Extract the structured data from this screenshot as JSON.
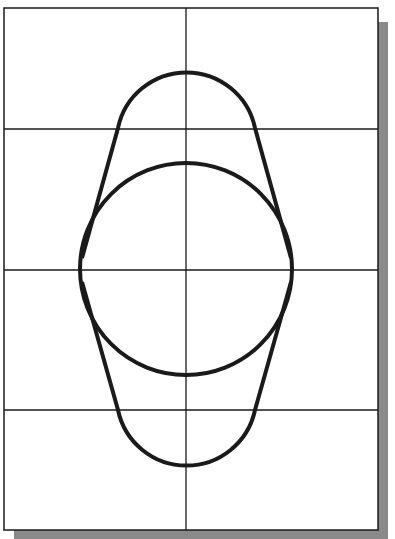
{
  "diagram": {
    "colors": {
      "line": "#1a1a1a",
      "shadow": "#8a8a8a",
      "paper": "#ffffff"
    },
    "frame": {
      "x": 4,
      "y": 8,
      "w": 374,
      "h": 522
    },
    "grid": {
      "vertical_x": [
        186
      ],
      "horizontal_y": [
        129,
        270,
        410
      ]
    },
    "circle": {
      "cx": 186,
      "cy": 269,
      "r": 106
    },
    "top_arc": {
      "cx": 186,
      "cy": 138,
      "r": 70
    },
    "bottom_arc": {
      "cx": 186,
      "cy": 400,
      "r": 70
    }
  }
}
